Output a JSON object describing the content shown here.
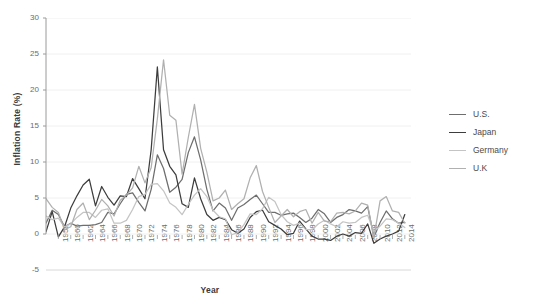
{
  "chart_data": {
    "type": "line",
    "title": "",
    "xlabel": "Year",
    "ylabel": "Inflation Rate (%)",
    "xlim": [
      1956,
      2015
    ],
    "ylim": [
      -5,
      30
    ],
    "yticks": [
      -5,
      0,
      5,
      10,
      15,
      20,
      25,
      30
    ],
    "grid": true,
    "legend_position": "right",
    "x": [
      1956,
      1957,
      1958,
      1959,
      1960,
      1961,
      1962,
      1963,
      1964,
      1965,
      1966,
      1967,
      1968,
      1969,
      1970,
      1971,
      1972,
      1973,
      1974,
      1975,
      1976,
      1977,
      1978,
      1979,
      1980,
      1981,
      1982,
      1983,
      1984,
      1985,
      1986,
      1987,
      1988,
      1989,
      1990,
      1991,
      1992,
      1993,
      1994,
      1995,
      1996,
      1997,
      1998,
      1999,
      2000,
      2001,
      2002,
      2003,
      2004,
      2005,
      2006,
      2007,
      2008,
      2009,
      2010,
      2011,
      2012,
      2013,
      2014
    ],
    "xtick_labels": [
      "1958",
      "1960",
      "1962",
      "1964",
      "1966",
      "1968",
      "1970",
      "1972",
      "1974",
      "1976",
      "1978",
      "1980",
      "1982",
      "1984",
      "1986",
      "1988",
      "1990",
      "1992",
      "1994",
      "1996",
      "1998",
      "2000",
      "2002",
      "2004",
      "2006",
      "2008",
      "2010",
      "2012",
      "2014"
    ],
    "xticks": [
      1958,
      1960,
      1962,
      1964,
      1966,
      1968,
      1970,
      1972,
      1974,
      1976,
      1978,
      1980,
      1982,
      1984,
      1986,
      1988,
      1990,
      1992,
      1994,
      1996,
      1998,
      2000,
      2002,
      2004,
      2006,
      2008,
      2010,
      2012,
      2014
    ],
    "series": [
      {
        "name": "U.S.",
        "color": "#6e6e6e",
        "values": [
          1.5,
          3.3,
          2.7,
          1.0,
          1.5,
          1.1,
          1.2,
          1.2,
          1.3,
          1.6,
          3.0,
          2.8,
          4.2,
          5.5,
          5.7,
          4.4,
          3.2,
          6.2,
          11.0,
          9.1,
          5.8,
          6.5,
          7.6,
          11.3,
          13.5,
          10.3,
          6.2,
          3.2,
          4.3,
          3.6,
          1.9,
          3.6,
          4.1,
          4.8,
          5.4,
          4.2,
          3.0,
          3.0,
          2.6,
          2.8,
          2.9,
          2.3,
          1.6,
          2.2,
          3.4,
          2.8,
          1.6,
          2.3,
          2.7,
          3.4,
          3.2,
          2.9,
          3.8,
          -0.4,
          1.6,
          3.2,
          2.1,
          1.5,
          1.6
        ]
      },
      {
        "name": "Japan",
        "color": "#3d3d3d",
        "values": [
          0.3,
          3.1,
          -0.4,
          1.0,
          3.6,
          5.3,
          6.8,
          7.6,
          3.9,
          6.6,
          5.1,
          4.0,
          5.3,
          5.2,
          7.7,
          6.3,
          4.9,
          11.7,
          23.2,
          11.7,
          9.4,
          8.2,
          4.2,
          3.7,
          7.8,
          4.9,
          2.7,
          1.9,
          2.3,
          2.0,
          0.6,
          0.1,
          0.7,
          2.3,
          3.1,
          3.3,
          1.7,
          1.2,
          0.7,
          -0.1,
          0.1,
          1.8,
          0.7,
          -0.3,
          -0.7,
          -0.7,
          -0.9,
          -0.3,
          0.0,
          -0.3,
          0.2,
          0.1,
          1.4,
          -1.3,
          -0.7,
          -0.3,
          0.0,
          0.4,
          2.7
        ]
      },
      {
        "name": "Germany",
        "color": "#c4c4c4",
        "values": [
          2.5,
          2.0,
          2.2,
          1.0,
          1.4,
          2.3,
          3.0,
          3.0,
          2.3,
          3.3,
          3.5,
          1.5,
          1.5,
          1.9,
          3.4,
          5.2,
          5.5,
          6.9,
          7.0,
          6.0,
          4.3,
          3.7,
          2.7,
          4.1,
          5.4,
          6.3,
          5.2,
          3.3,
          2.4,
          2.1,
          -0.1,
          0.2,
          1.3,
          2.8,
          2.7,
          3.5,
          5.1,
          4.5,
          2.7,
          1.7,
          1.2,
          1.5,
          0.6,
          0.6,
          1.4,
          1.9,
          1.4,
          1.0,
          1.7,
          1.5,
          1.6,
          2.3,
          2.6,
          0.3,
          1.1,
          2.1,
          2.0,
          1.5,
          0.9
        ]
      },
      {
        "name": "U.K",
        "color": "#b0b0b0",
        "values": [
          4.9,
          3.7,
          3.0,
          0.6,
          1.0,
          3.4,
          4.3,
          2.0,
          3.3,
          4.8,
          3.9,
          2.5,
          4.7,
          5.4,
          6.4,
          9.4,
          7.1,
          9.2,
          16.0,
          24.2,
          16.5,
          15.8,
          8.3,
          13.4,
          18.0,
          11.9,
          8.6,
          4.6,
          5.0,
          6.1,
          3.4,
          4.2,
          4.9,
          7.8,
          9.5,
          5.9,
          3.7,
          1.6,
          2.5,
          3.4,
          2.4,
          3.1,
          3.4,
          1.5,
          3.0,
          1.8,
          1.7,
          2.9,
          3.0,
          2.8,
          3.2,
          4.3,
          4.0,
          -0.5,
          4.6,
          5.2,
          3.2,
          3.0,
          1.5
        ]
      }
    ]
  }
}
